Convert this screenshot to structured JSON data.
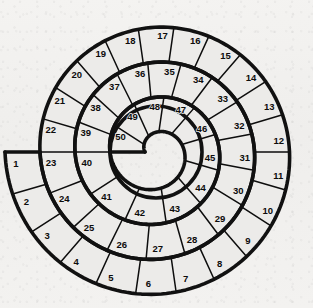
{
  "board": {
    "title": "Spiral Track Board",
    "shape": "spiral",
    "direction": "clockwise",
    "turns": 3,
    "total_cells": 50,
    "start_cell": 1,
    "end_cell": 50,
    "colors": {
      "background": "#f2f1ef",
      "cell_fill": "#ecebe9",
      "outline": "#111111",
      "divider": "#0d0d0d",
      "number_text": "#0c0c0c"
    },
    "geometry": {
      "center_x": 156,
      "center_y": 152,
      "outer_radius": 151,
      "hole_radius": 46,
      "start_angle_deg": 180
    },
    "rings": [
      {
        "name": "outer-ring",
        "first": 1,
        "last": 22,
        "count": 22
      },
      {
        "name": "middle-ring",
        "first": 23,
        "last": 39,
        "count": 17
      },
      {
        "name": "inner-ring",
        "first": 40,
        "last": 50,
        "count": 11
      }
    ],
    "cells": [
      {
        "n": 1
      },
      {
        "n": 2
      },
      {
        "n": 3
      },
      {
        "n": 4
      },
      {
        "n": 5
      },
      {
        "n": 6
      },
      {
        "n": 7
      },
      {
        "n": 8
      },
      {
        "n": 9
      },
      {
        "n": 10
      },
      {
        "n": 11
      },
      {
        "n": 12
      },
      {
        "n": 13
      },
      {
        "n": 14
      },
      {
        "n": 15
      },
      {
        "n": 16
      },
      {
        "n": 17
      },
      {
        "n": 18
      },
      {
        "n": 19
      },
      {
        "n": 20
      },
      {
        "n": 21
      },
      {
        "n": 22
      },
      {
        "n": 23
      },
      {
        "n": 24
      },
      {
        "n": 25
      },
      {
        "n": 26
      },
      {
        "n": 27
      },
      {
        "n": 28
      },
      {
        "n": 29
      },
      {
        "n": 30
      },
      {
        "n": 31
      },
      {
        "n": 32
      },
      {
        "n": 33
      },
      {
        "n": 34
      },
      {
        "n": 35
      },
      {
        "n": 36
      },
      {
        "n": 37
      },
      {
        "n": 38
      },
      {
        "n": 39
      },
      {
        "n": 40
      },
      {
        "n": 41
      },
      {
        "n": 42
      },
      {
        "n": 43
      },
      {
        "n": 44
      },
      {
        "n": 45
      },
      {
        "n": 46
      },
      {
        "n": 47
      },
      {
        "n": 48
      },
      {
        "n": 49
      },
      {
        "n": 50
      }
    ],
    "labels": {
      "1": "1",
      "2": "2",
      "3": "3",
      "4": "4",
      "5": "5",
      "6": "6",
      "7": "7",
      "8": "8",
      "9": "9",
      "10": "10",
      "11": "11",
      "12": "12",
      "13": "13",
      "14": "14",
      "15": "15",
      "16": "16",
      "17": "17",
      "18": "18",
      "19": "19",
      "20": "20",
      "21": "21",
      "22": "22",
      "23": "23",
      "24": "24",
      "25": "25",
      "26": "26",
      "27": "27",
      "28": "28",
      "29": "29",
      "30": "30",
      "31": "31",
      "32": "32",
      "33": "33",
      "34": "34",
      "35": "35",
      "36": "36",
      "37": "37",
      "38": "38",
      "39": "39",
      "40": "40",
      "41": "41",
      "42": "42",
      "43": "43",
      "44": "44",
      "45": "45",
      "46": "46",
      "47": "47",
      "48": "48",
      "49": "49",
      "50": "50"
    }
  }
}
